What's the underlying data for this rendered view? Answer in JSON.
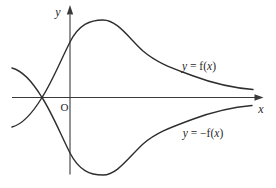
{
  "figure": {
    "background": "#ffffff",
    "curve_color": "#2e2e2e",
    "axis_color": "#3a3a3a",
    "text_color": "#1f1f1f"
  },
  "labels": {
    "y_axis": "y",
    "x_axis": "x",
    "origin": "O",
    "f_label": {
      "lhs": "y",
      "mid": " = f(",
      "arg": "x",
      "close": ")"
    },
    "negf_label": {
      "lhs": "y",
      "mid": " = −f(",
      "arg": "x",
      "close": ")"
    }
  },
  "paths": {
    "f_curve": "M12,127 C24,124 35,109 42,97.5 C52,82 60,62 70,42 C79,24.5 90,20 103,20 C117,20 128,37 143,51 C157,63 172,68 192,75.5 C212,83 234,88 253,89.5",
    "negf_curve": "M12,68 C24,71 35,86 42,97.5 C52,113 60,133 70,153 C79,170.5 90,175 103,175 C117,175 128,158 143,144 C157,132 172,127 192,119.5 C212,112 234,107 252,105.5",
    "x_axis_line": "M12,97.5 H255",
    "y_axis_line": "M70,174.5 V14.5",
    "x_arrowhead_points": "263.5,97.5 254.5,94.3 254.5,100.7",
    "y_arrowhead_points": "70,5 66.8,14.5 73.2,14.5"
  },
  "chart_data": {
    "type": "line",
    "title": "",
    "xlabel": "x",
    "ylabel": "y",
    "grid": false,
    "ticks": "none (unlabeled axes, origin marked O)",
    "x_range": [
      -1.95,
      6.45
    ],
    "y_range": [
      -3.1,
      3.1
    ],
    "legend_position": "inline annotations beside curves",
    "series": [
      {
        "name": "y = f(x)",
        "annotation": "y = f(x)",
        "points": [
          [
            -1.93,
            -0.98
          ],
          [
            -1.4,
            -0.55
          ],
          [
            -0.93,
            0
          ],
          [
            -0.5,
            0.92
          ],
          [
            0,
            1.85
          ],
          [
            0.55,
            2.5
          ],
          [
            1.1,
            2.58
          ],
          [
            1.6,
            2.3
          ],
          [
            2.4,
            1.55
          ],
          [
            3.2,
            1.07
          ],
          [
            4.1,
            0.73
          ],
          [
            5.0,
            0.42
          ],
          [
            6.1,
            0.27
          ]
        ],
        "description": "crosses x-axis left of origin, rises through y-axis, peaks right of y-axis, decays toward x-axis as x increases"
      },
      {
        "name": "y = −f(x)",
        "annotation": "y = −f(x)",
        "points": [
          [
            -1.93,
            0.98
          ],
          [
            -1.4,
            0.55
          ],
          [
            -0.93,
            0
          ],
          [
            -0.5,
            -0.92
          ],
          [
            0,
            -1.85
          ],
          [
            0.55,
            -2.5
          ],
          [
            1.1,
            -2.58
          ],
          [
            1.6,
            -2.3
          ],
          [
            2.4,
            -1.55
          ],
          [
            3.2,
            -1.07
          ],
          [
            4.1,
            -0.73
          ],
          [
            5.0,
            -0.42
          ],
          [
            6.1,
            -0.27
          ]
        ],
        "description": "mirror image of y = f(x) across the x-axis"
      }
    ]
  }
}
